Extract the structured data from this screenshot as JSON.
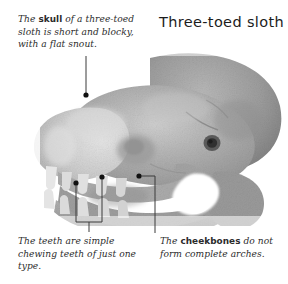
{
  "figure": {
    "title": "Three-toed sloth",
    "image_type": "grayscale photograph",
    "background_color": "#ffffff",
    "text_color": "#2b2b2b",
    "leader_line_color": "#3a3a3a"
  },
  "captions": {
    "skull": {
      "lead": "The ",
      "term": "skull",
      "rest": " of a three-toed sloth is short and blocky, with a flat snout.",
      "full_text": "The skull of a three-toed sloth is short and blocky, with a flat snout.",
      "position": "top-left"
    },
    "teeth": {
      "lead": "",
      "term": "",
      "rest": "The teeth are simple chewing teeth of just one type.",
      "full_text": "The teeth are simple chewing teeth of just one type.",
      "position": "bottom-left"
    },
    "cheekbones": {
      "lead": "The ",
      "term": "cheekbones",
      "rest": " do not form complete arches.",
      "full_text": "The cheekbones do not form complete arches.",
      "position": "bottom-right"
    }
  },
  "annotations": [
    {
      "name": "skull-callout",
      "label": "skull",
      "dot": [
        86,
        95
      ],
      "target": "cranium"
    },
    {
      "name": "teeth-callout-1",
      "label": "teeth",
      "dot": [
        76,
        183
      ],
      "target": "lower tooth"
    },
    {
      "name": "teeth-callout-2",
      "label": "teeth",
      "dot": [
        102,
        177
      ],
      "target": "upper tooth"
    },
    {
      "name": "cheekbones-callout",
      "label": "cheekbones",
      "dot": [
        139,
        176
      ],
      "target": "zygomatic region"
    }
  ],
  "photo": {
    "alt": "Lateral view of a three-toed sloth skull, snout to the left, showing simple peg-like teeth, a blunt flat snout, an incomplete cheekbone arch and a round ear opening at the rear.",
    "tones": {
      "highlight": "#e8e8e8",
      "light": "#c9c9c9",
      "mid": "#a9a9a9",
      "shadow": "#8b8b8b",
      "dark": "#6e6e6e"
    }
  }
}
